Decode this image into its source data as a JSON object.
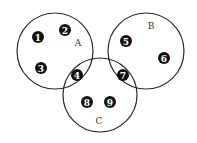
{
  "diagram": {
    "type": "venn",
    "sets": [
      {
        "id": "A",
        "label": "A",
        "cx": 55,
        "cy": 51,
        "r": 38,
        "label_x": 78,
        "label_y": 43
      },
      {
        "id": "B",
        "label": "B",
        "cx": 146,
        "cy": 51,
        "r": 38,
        "label_x": 151,
        "label_y": 26
      },
      {
        "id": "C",
        "label": "C",
        "cx": 100,
        "cy": 95,
        "r": 37,
        "label_x": 99,
        "label_y": 121
      }
    ],
    "markers": [
      {
        "num": "1",
        "x": 38,
        "y": 37,
        "region": "A only"
      },
      {
        "num": "2",
        "x": 65,
        "y": 30,
        "region": "A only"
      },
      {
        "num": "3",
        "x": 41,
        "y": 68,
        "region": "A only"
      },
      {
        "num": "4",
        "x": 77,
        "y": 75,
        "region": "A and C"
      },
      {
        "num": "5",
        "x": 126,
        "y": 41,
        "region": "B only"
      },
      {
        "num": "6",
        "x": 164,
        "y": 58,
        "region": "B only"
      },
      {
        "num": "7",
        "x": 123,
        "y": 75,
        "region": "B and C"
      },
      {
        "num": "8",
        "x": 87,
        "y": 102,
        "region": "C only"
      },
      {
        "num": "9",
        "x": 110,
        "y": 102,
        "region": "C only"
      }
    ],
    "colors": {
      "stroke": "#2a2a2a",
      "marker_fill": "#111111",
      "marker_text": "#ffffff",
      "label": "#333333"
    }
  }
}
